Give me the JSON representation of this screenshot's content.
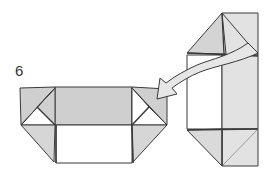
{
  "diagram": {
    "step_number": "6",
    "colors": {
      "shade": "#cfcfcf",
      "light_shade": "#e2e2e2",
      "paper": "#ffffff",
      "line": "#3a3a3a",
      "arrow_fill": "#e6e6e6"
    },
    "elements": [
      {
        "name": "left-box-model",
        "kind": "folded-model",
        "orientation": "horizontal"
      },
      {
        "name": "right-tower-model",
        "kind": "folded-model",
        "orientation": "vertical"
      },
      {
        "name": "curved-arrow",
        "kind": "arrow",
        "direction": "from right model to left model"
      }
    ]
  }
}
